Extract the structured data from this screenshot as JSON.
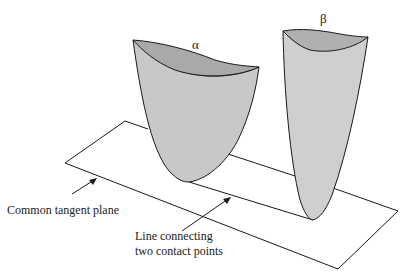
{
  "diagram": {
    "surfaces": [
      {
        "id": "alpha",
        "label": "α",
        "fill": "#c8c8c8"
      },
      {
        "id": "beta",
        "label": "β",
        "fill": "#cfcfcf"
      }
    ],
    "annotations": {
      "plane_label": "Common tangent plane",
      "line_label_1": "Line connecting",
      "line_label_2": "two contact points"
    },
    "colors": {
      "stroke": "#1a1a1a",
      "surface_fill": "#c8c8c8",
      "rim_fill": "#a8a8a8",
      "background": "#ffffff"
    }
  }
}
